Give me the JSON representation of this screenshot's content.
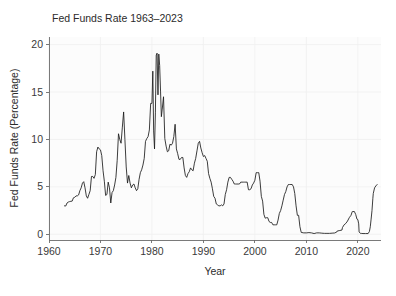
{
  "chart_data": {
    "type": "line",
    "title": "Fed Funds Rate 1963–2023",
    "xlabel": "Year",
    "ylabel": "Fed Funds Rate (Percentage)",
    "xlim": [
      1960,
      2024.5
    ],
    "ylim": [
      -0.6,
      20.8
    ],
    "xticks": [
      1960,
      1970,
      1980,
      1990,
      2000,
      2010,
      2020
    ],
    "xtick_labels": [
      "1960",
      "1970",
      "1980",
      "1990",
      "2000",
      "2010",
      "2020"
    ],
    "yticks": [
      0,
      5,
      10,
      15,
      20
    ],
    "ytick_labels": [
      "0",
      "5",
      "10",
      "15",
      "20"
    ],
    "grid": true,
    "legend": "none",
    "line_color": "#1a1a1a",
    "background_color": "#fcfcfc",
    "series": [
      {
        "name": "Fed Funds Rate",
        "x": [
          1963.0,
          1963.25,
          1963.5,
          1963.75,
          1964.0,
          1964.25,
          1964.5,
          1964.75,
          1965.0,
          1965.25,
          1965.5,
          1965.75,
          1966.0,
          1966.25,
          1966.5,
          1966.75,
          1967.0,
          1967.25,
          1967.5,
          1967.75,
          1968.0,
          1968.25,
          1968.5,
          1968.75,
          1969.0,
          1969.25,
          1969.5,
          1969.75,
          1970.0,
          1970.25,
          1970.5,
          1970.75,
          1971.0,
          1971.25,
          1971.5,
          1971.75,
          1972.0,
          1972.25,
          1972.5,
          1972.75,
          1973.0,
          1973.25,
          1973.5,
          1973.75,
          1974.0,
          1974.25,
          1974.5,
          1974.75,
          1975.0,
          1975.25,
          1975.5,
          1975.75,
          1976.0,
          1976.25,
          1976.5,
          1976.75,
          1977.0,
          1977.25,
          1977.5,
          1977.75,
          1978.0,
          1978.25,
          1978.5,
          1978.75,
          1979.0,
          1979.25,
          1979.5,
          1979.75,
          1980.0,
          1980.17,
          1980.33,
          1980.5,
          1980.67,
          1980.83,
          1981.0,
          1981.17,
          1981.33,
          1981.5,
          1981.67,
          1981.83,
          1982.0,
          1982.25,
          1982.5,
          1982.75,
          1983.0,
          1983.25,
          1983.5,
          1983.75,
          1984.0,
          1984.25,
          1984.5,
          1984.75,
          1985.0,
          1985.25,
          1985.5,
          1985.75,
          1986.0,
          1986.25,
          1986.5,
          1986.75,
          1987.0,
          1987.25,
          1987.5,
          1987.75,
          1988.0,
          1988.25,
          1988.5,
          1988.75,
          1989.0,
          1989.25,
          1989.5,
          1989.75,
          1990.0,
          1990.25,
          1990.5,
          1990.75,
          1991.0,
          1991.25,
          1991.5,
          1991.75,
          1992.0,
          1992.25,
          1992.5,
          1992.75,
          1993.0,
          1993.25,
          1993.5,
          1993.75,
          1994.0,
          1994.25,
          1994.5,
          1994.75,
          1995.0,
          1995.25,
          1995.5,
          1995.75,
          1996.0,
          1996.25,
          1996.5,
          1996.75,
          1997.0,
          1997.25,
          1997.5,
          1997.75,
          1998.0,
          1998.25,
          1998.5,
          1998.75,
          1999.0,
          1999.25,
          1999.5,
          1999.75,
          2000.0,
          2000.25,
          2000.5,
          2000.75,
          2001.0,
          2001.25,
          2001.5,
          2001.75,
          2002.0,
          2002.25,
          2002.5,
          2002.75,
          2003.0,
          2003.25,
          2003.5,
          2003.75,
          2004.0,
          2004.25,
          2004.5,
          2004.75,
          2005.0,
          2005.25,
          2005.5,
          2005.75,
          2006.0,
          2006.25,
          2006.5,
          2006.75,
          2007.0,
          2007.25,
          2007.5,
          2007.75,
          2008.0,
          2008.25,
          2008.5,
          2008.75,
          2009.0,
          2009.5,
          2010.0,
          2010.5,
          2011.0,
          2011.5,
          2012.0,
          2012.5,
          2013.0,
          2013.5,
          2014.0,
          2014.5,
          2015.0,
          2015.5,
          2015.92,
          2016.0,
          2016.5,
          2016.92,
          2017.0,
          2017.33,
          2017.67,
          2018.0,
          2018.33,
          2018.67,
          2018.92,
          2019.0,
          2019.33,
          2019.58,
          2019.83,
          2020.0,
          2020.17,
          2020.25,
          2020.5,
          2020.75,
          2021.0,
          2021.5,
          2022.0,
          2022.25,
          2022.42,
          2022.58,
          2022.75,
          2022.92,
          2023.0,
          2023.25,
          2023.5,
          2023.75
        ],
        "y": [
          3.0,
          2.98,
          3.3,
          3.4,
          3.45,
          3.48,
          3.5,
          3.85,
          3.9,
          4.05,
          4.05,
          4.15,
          4.6,
          4.9,
          5.4,
          5.55,
          4.9,
          4.05,
          3.8,
          4.2,
          4.6,
          6.1,
          6.1,
          5.9,
          6.3,
          8.7,
          9.2,
          9.0,
          8.9,
          8.3,
          6.7,
          5.6,
          4.1,
          4.2,
          5.5,
          4.9,
          3.3,
          4.4,
          4.6,
          5.2,
          6.0,
          7.8,
          10.6,
          10.0,
          9.6,
          11.3,
          12.9,
          10.0,
          7.1,
          5.4,
          6.2,
          5.4,
          4.9,
          5.2,
          5.3,
          4.9,
          4.6,
          4.8,
          5.8,
          6.5,
          6.8,
          7.3,
          8.0,
          9.8,
          10.1,
          10.3,
          11.0,
          13.8,
          13.8,
          17.2,
          10.9,
          9.0,
          12.8,
          18.9,
          19.1,
          14.7,
          19.0,
          17.8,
          15.1,
          12.4,
          13.2,
          14.5,
          10.1,
          9.3,
          8.7,
          8.8,
          9.5,
          9.4,
          9.6,
          10.3,
          11.6,
          9.0,
          8.5,
          7.9,
          7.9,
          8.1,
          8.1,
          7.0,
          6.2,
          6.0,
          6.4,
          6.6,
          7.0,
          6.8,
          6.7,
          7.5,
          8.0,
          8.8,
          9.6,
          9.8,
          9.1,
          8.6,
          8.2,
          8.3,
          8.0,
          7.7,
          6.4,
          5.9,
          5.5,
          4.8,
          4.0,
          3.8,
          3.2,
          3.1,
          3.0,
          3.0,
          3.1,
          3.0,
          3.2,
          4.2,
          4.7,
          5.5,
          6.0,
          6.0,
          5.8,
          5.6,
          5.3,
          5.3,
          5.3,
          5.3,
          5.3,
          5.5,
          5.5,
          5.5,
          5.5,
          5.5,
          5.5,
          4.7,
          4.7,
          4.8,
          5.2,
          5.4,
          5.7,
          6.5,
          6.5,
          6.5,
          5.6,
          4.0,
          3.5,
          2.1,
          1.7,
          1.75,
          1.75,
          1.35,
          1.25,
          1.25,
          1.0,
          1.0,
          1.0,
          1.0,
          1.5,
          2.2,
          2.5,
          3.0,
          3.6,
          4.2,
          4.5,
          5.0,
          5.25,
          5.25,
          5.25,
          5.25,
          5.0,
          4.3,
          3.0,
          2.0,
          2.0,
          0.8,
          0.2,
          0.15,
          0.15,
          0.18,
          0.15,
          0.08,
          0.15,
          0.15,
          0.12,
          0.1,
          0.1,
          0.1,
          0.12,
          0.14,
          0.25,
          0.35,
          0.4,
          0.45,
          0.7,
          1.0,
          1.15,
          1.4,
          1.75,
          2.0,
          2.4,
          2.4,
          2.4,
          2.1,
          1.6,
          1.55,
          1.1,
          0.25,
          0.1,
          0.09,
          0.08,
          0.08,
          0.08,
          0.3,
          0.8,
          1.6,
          2.5,
          3.8,
          4.3,
          4.9,
          5.1,
          5.25
        ]
      }
    ]
  },
  "figure": {
    "title_x": 52,
    "title_y": 22
  }
}
